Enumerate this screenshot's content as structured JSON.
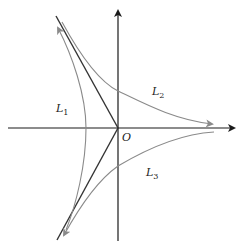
{
  "diagram": {
    "type": "coordinate-plane-curves",
    "origin_label": "O",
    "axes": {
      "x_axis": {
        "from": [
          8,
          128
        ],
        "to": [
          235,
          128
        ],
        "arrow": "right"
      },
      "y_axis": {
        "from": [
          118,
          240
        ],
        "to": [
          118,
          10
        ],
        "arrow": "up"
      }
    },
    "curves": [
      {
        "id": "L1",
        "label": "L",
        "subscript": "1",
        "label_pos": [
          60,
          112
        ],
        "description": "left arc opening left, arrows at both ends (up-left and down-left)"
      },
      {
        "id": "L2",
        "label": "L",
        "subscript": "2",
        "label_pos": [
          152,
          95
        ],
        "description": "curve from upper-left to right, asymptotic to positive x-axis, arrow pointing right"
      },
      {
        "id": "L3",
        "label": "L",
        "subscript": "3",
        "label_pos": [
          147,
          175
        ],
        "description": "curve from right to lower-left, arrow pointing down-left"
      }
    ],
    "lines": [
      {
        "id": "ray-upper",
        "from": [
          56,
          16
        ],
        "to": [
          118,
          128
        ]
      },
      {
        "id": "ray-lower",
        "from": [
          118,
          128
        ],
        "to": [
          57,
          240
        ]
      }
    ],
    "colors": {
      "axis": "#1a1a1a",
      "ray": "#333333",
      "curve": "#8a8a8a",
      "label": "#222222"
    }
  }
}
